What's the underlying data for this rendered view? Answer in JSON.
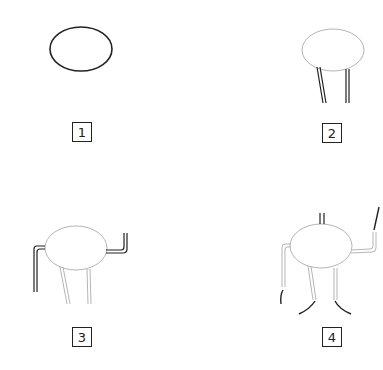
{
  "diagram": {
    "title": "",
    "colors": {
      "current_stroke": "#222222",
      "previous_stroke": "#b0b0b0",
      "background": "#ffffff"
    },
    "steps": [
      {
        "number": "1",
        "label": "Draw an oval body"
      },
      {
        "number": "2",
        "label": "Add two legs below the oval"
      },
      {
        "number": "3",
        "label": "Add bent arms on both sides"
      },
      {
        "number": "4",
        "label": "Add feet, hands and antennae"
      }
    ]
  }
}
